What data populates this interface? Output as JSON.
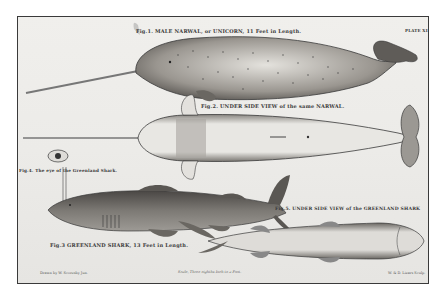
{
  "plate": {
    "plate_number": "PLATE XI",
    "figures": [
      {
        "id": "fig1",
        "caption": "Fig.1. MALE NARWAL, or UNICORN, 11 Feet in Length."
      },
      {
        "id": "fig2",
        "caption": "Fig.2. UNDER SIDE VIEW of the same NARWAL."
      },
      {
        "id": "fig3",
        "caption": "Fig.3 GREENLAND SHARK, 13 Feet in Length."
      },
      {
        "id": "fig4",
        "caption": "Fig.4. The eye of the Greenland Shark."
      },
      {
        "id": "fig5",
        "caption": "Fig.5. UNDER SIDE VIEW of the GREENLAND SHARK"
      }
    ],
    "footer": {
      "left": "Drawn by W. Scoresby Jun.",
      "center": "Scale, Three eighths Inch to a Foot.",
      "right": "W. & D. Lizars Sculp."
    }
  },
  "colors": {
    "paper": "#ecebe8",
    "ink": "#3a3a3a",
    "frame": "#3a3a3a"
  }
}
